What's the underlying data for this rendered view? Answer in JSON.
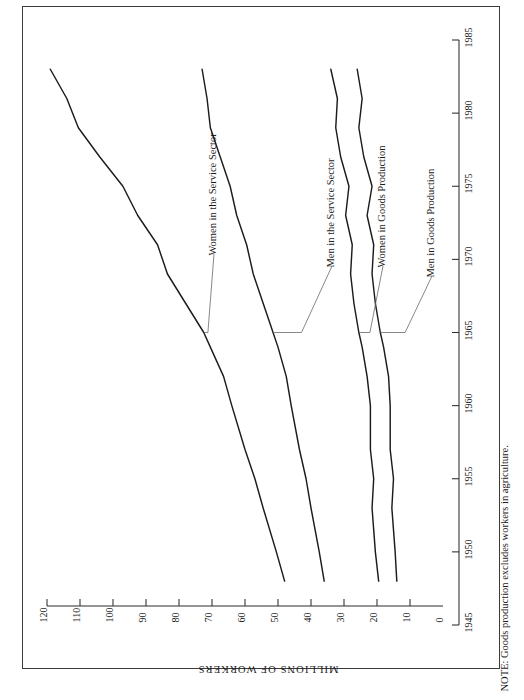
{
  "title": "Number of Men and Women Workers by Sector of Employment",
  "note": "NOTE: Goods production excludes workers in agriculture.",
  "axis_name": "MILLIONS OF WORKERS",
  "labels": {
    "women_service": "Women in the Service Sector",
    "men_service": "Men in the Service Sector",
    "women_goods": "Women in Goods Production",
    "men_goods": "Men in Goods Production"
  },
  "value_ticks": [
    "120",
    "110",
    "100",
    "90",
    "80",
    "70",
    "60",
    "50",
    "40",
    "30",
    "20",
    "10",
    "0"
  ],
  "year_ticks": [
    "1945",
    "1950",
    "1955",
    "1960",
    "1965",
    "1970",
    "1975",
    "1980",
    "1985"
  ],
  "chart_data": {
    "type": "line",
    "title": "Number of Men and Women Workers by Sector of Employment",
    "subtitle": "",
    "note": "NOTE: Goods production excludes workers in agriculture.",
    "orientation": "rotated-90ccw",
    "xlabel": "",
    "ylabel": "MILLIONS OF WORKERS",
    "xlim": [
      1945,
      1985
    ],
    "ylim": [
      0,
      120
    ],
    "grid": false,
    "legend": "inline-annotations",
    "x": [
      1948,
      1950,
      1953,
      1955,
      1957,
      1960,
      1962,
      1964,
      1965,
      1967,
      1969,
      1971,
      1973,
      1975,
      1977,
      1979,
      1981,
      1983
    ],
    "series": [
      {
        "name": "Women in the Service Sector",
        "values": [
          48.0,
          50.5,
          54.5,
          57.0,
          60.0,
          64.0,
          66.5,
          70.5,
          72.5,
          78.0,
          83.5,
          86.5,
          92.5,
          97.0,
          104.0,
          110.5,
          114.0,
          119.0
        ]
      },
      {
        "name": "Men in the Service Sector",
        "values": [
          36.0,
          37.5,
          40.0,
          41.5,
          43.5,
          46.0,
          47.5,
          50.0,
          51.5,
          54.5,
          57.5,
          59.5,
          62.5,
          64.5,
          67.5,
          70.5,
          71.5,
          73.0
        ]
      },
      {
        "name": "Women in Goods Production",
        "values": [
          19.5,
          20.5,
          21.5,
          21.0,
          22.0,
          22.0,
          23.0,
          24.5,
          25.5,
          27.0,
          28.0,
          27.5,
          29.5,
          28.5,
          31.0,
          32.5,
          32.0,
          34.0
        ]
      },
      {
        "name": "Men in Goods Production",
        "values": [
          14.0,
          14.5,
          15.5,
          15.0,
          16.0,
          16.0,
          16.5,
          18.0,
          19.0,
          20.5,
          21.5,
          21.0,
          23.0,
          21.5,
          24.0,
          25.5,
          24.5,
          26.0
        ]
      }
    ]
  }
}
